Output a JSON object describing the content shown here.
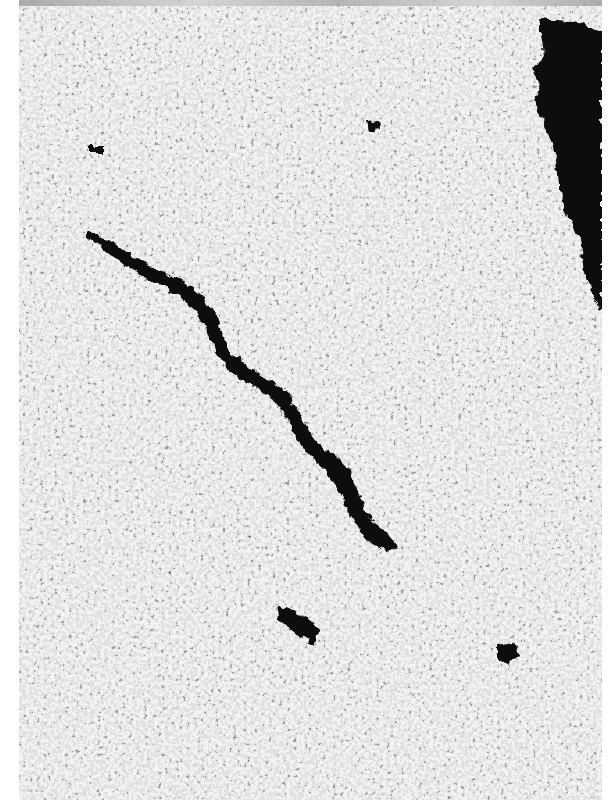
{
  "image": {
    "kind": "grayscale micrograph",
    "description": "Dense granular particle monolayer with dark void regions and a diagonal crack",
    "frame": {
      "x": 19,
      "y": 0,
      "width": 583,
      "height": 800
    },
    "colors": {
      "background_margin": "#ffffff",
      "particle_light": "#e6e6e6",
      "particle_mid": "#b9b9b9",
      "void_dark": "#0a0a0a"
    },
    "features": [
      {
        "name": "large-void-top-right",
        "approx_bbox": [
          530,
          15,
          602,
          310
        ]
      },
      {
        "name": "diagonal-crack",
        "from": [
          88,
          230
        ],
        "to": [
          395,
          555
        ]
      },
      {
        "name": "small-crack-lower",
        "approx_bbox": [
          275,
          600,
          330,
          650
        ]
      },
      {
        "name": "small-void-lower-right",
        "approx_bbox": [
          495,
          640,
          520,
          665
        ]
      },
      {
        "name": "small-spot-top",
        "approx_bbox": [
          365,
          120,
          380,
          132
        ]
      }
    ]
  }
}
